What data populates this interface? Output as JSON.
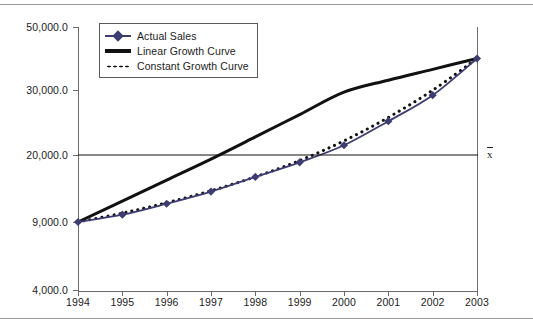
{
  "figure": {
    "mean_marker_label": "x",
    "mean_marker_title": "x-bar (mean)"
  },
  "legend": {
    "position": "top-left-inside",
    "entries": [
      {
        "label": "Actual Sales",
        "icon": "diamond-line-marker",
        "color": "#3d3d72",
        "style": "solid-with-markers"
      },
      {
        "label": "Linear Growth Curve",
        "icon": "thick-line-marker",
        "color": "#111111",
        "style": "thick-solid"
      },
      {
        "label": "Constant Growth Curve",
        "icon": "dotted-line-marker",
        "color": "#111111",
        "style": "dotted"
      }
    ]
  },
  "chart_data": {
    "type": "line",
    "title": "",
    "subtitle": "",
    "xlabel": "",
    "ylabel": "",
    "grid": false,
    "legend_position": "upper left",
    "categories": [
      "1994",
      "1995",
      "1996",
      "1997",
      "1998",
      "1999",
      "2000",
      "2001",
      "2002",
      "2003"
    ],
    "x": [
      1994,
      1995,
      1996,
      1997,
      1998,
      1999,
      2000,
      2001,
      2002,
      2003
    ],
    "ytick_labels": [
      "50,000.0",
      "30,000.0",
      "20,000.0",
      "9,000.0",
      "4,000.0"
    ],
    "ytick_values": [
      50000,
      30000,
      20000,
      9000,
      4000
    ],
    "ylim": [
      4000,
      50000
    ],
    "yaxis_scale": "non-linear (tick positions equally spaced in pixels)",
    "series": [
      {
        "name": "Actual Sales",
        "color": "#3d3d72",
        "style": "solid-with-markers",
        "marker": "diamond",
        "values": [
          9000,
          10200,
          12000,
          14000,
          16400,
          18800,
          21500,
          25200,
          29200,
          40000
        ]
      },
      {
        "name": "Linear Growth Curve",
        "color": "#111111",
        "style": "thick-solid",
        "marker": "none",
        "values": [
          9000,
          12444,
          15889,
          19333,
          22778,
          26222,
          29667,
          33111,
          36556,
          40000
        ]
      },
      {
        "name": "Constant Growth Curve",
        "color": "#111111",
        "style": "dotted",
        "marker": "none",
        "values": [
          9000,
          10460,
          12160,
          14130,
          16420,
          19090,
          22180,
          25780,
          29960,
          40000
        ]
      }
    ],
    "annotations": [
      {
        "name": "mean-reference-line",
        "type": "horizontal-line",
        "value": 20000,
        "label": "x̄",
        "color": "#111111"
      }
    ]
  },
  "ytick_label_0": "50,000.0",
  "ytick_label_1": "30,000.0",
  "ytick_label_2": "20,000.0",
  "ytick_label_3": "9,000.0",
  "ytick_label_4": "4,000.0"
}
